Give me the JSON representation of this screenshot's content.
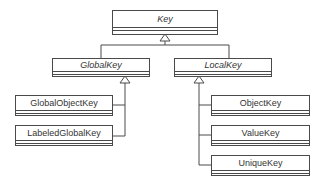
{
  "diagram": {
    "type": "uml-class-hierarchy",
    "root": {
      "name": "Key",
      "abstract": true
    },
    "level1": [
      {
        "name": "GlobalKey",
        "abstract": true
      },
      {
        "name": "LocalKey",
        "abstract": true
      }
    ],
    "global_children": [
      {
        "name": "GlobalObjectKey",
        "abstract": false
      },
      {
        "name": "LabeledGlobalKey",
        "abstract": false
      }
    ],
    "local_children": [
      {
        "name": "ObjectKey",
        "abstract": false
      },
      {
        "name": "ValueKey",
        "abstract": false
      },
      {
        "name": "UniqueKey",
        "abstract": false
      }
    ],
    "relations": [
      {
        "from": "GlobalKey",
        "to": "Key",
        "kind": "inheritance"
      },
      {
        "from": "LocalKey",
        "to": "Key",
        "kind": "inheritance"
      },
      {
        "from": "GlobalObjectKey",
        "to": "GlobalKey",
        "kind": "inheritance"
      },
      {
        "from": "LabeledGlobalKey",
        "to": "GlobalKey",
        "kind": "inheritance"
      },
      {
        "from": "ObjectKey",
        "to": "LocalKey",
        "kind": "inheritance"
      },
      {
        "from": "ValueKey",
        "to": "LocalKey",
        "kind": "inheritance"
      },
      {
        "from": "UniqueKey",
        "to": "LocalKey",
        "kind": "inheritance"
      }
    ],
    "colors": {
      "line": "#4a4a4a",
      "text": "#333333",
      "background": "#ffffff"
    }
  }
}
